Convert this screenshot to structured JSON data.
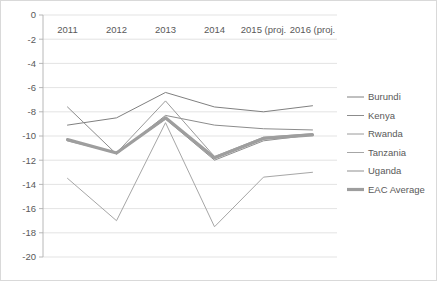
{
  "chart_data": {
    "type": "line",
    "title": "",
    "subtitle": "",
    "xlabel": "",
    "ylabel": "",
    "categories": [
      "2011",
      "2012",
      "2013",
      "2014",
      "2015 (proj.",
      "2016 (proj."
    ],
    "ylim": [
      -20,
      0
    ],
    "ytick_labels": [
      "0",
      "-2",
      "-4",
      "-6",
      "-8",
      "-10",
      "-12",
      "-14",
      "-16",
      "-18",
      "-20"
    ],
    "ytick_values": [
      0,
      -2,
      -4,
      -6,
      -8,
      -10,
      -12,
      -14,
      -16,
      -18,
      -20
    ],
    "grid": true,
    "legend_position": "right",
    "series": [
      {
        "name": "Burundi",
        "color": "#808080",
        "width": 1.0,
        "values": [
          -9.1,
          -8.5,
          -6.4,
          -7.6,
          -8.0,
          -7.5
        ]
      },
      {
        "name": "Kenya",
        "color": "#8c8c8c",
        "width": 1.0,
        "values": [
          -7.6,
          -11.5,
          -8.3,
          -9.1,
          -9.4,
          -9.5
        ]
      },
      {
        "name": "Rwanda",
        "color": "#9a9a9a",
        "width": 1.0,
        "values": [
          -10.4,
          -11.4,
          -7.1,
          -11.7,
          -10.1,
          -9.8
        ]
      },
      {
        "name": "Tanzania",
        "color": "#a6a6a6",
        "width": 1.0,
        "values": [
          -13.5,
          -17.0,
          -8.9,
          -17.5,
          -13.4,
          -13.0
        ]
      },
      {
        "name": "Uganda",
        "color": "#8f8f8f",
        "width": 1.0,
        "values": [
          -10.3,
          -11.4,
          -8.6,
          -12.0,
          -10.4,
          -9.9
        ]
      },
      {
        "name": "EAC Average",
        "color": "#9e9e9e",
        "width": 3.2,
        "values": [
          -10.3,
          -11.4,
          -8.5,
          -11.8,
          -10.2,
          -9.9
        ]
      }
    ]
  }
}
